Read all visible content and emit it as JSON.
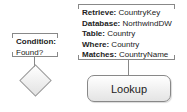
{
  "condition_note": {
    "label": "Condition:",
    "value": "Found?"
  },
  "lookup_note": {
    "rows": [
      {
        "key": "Retrieve:",
        "value": " CountryKey"
      },
      {
        "key": "Database:",
        "value": " NorthwindDW"
      },
      {
        "key": "Table:",
        "value": " Country"
      },
      {
        "key": "Where:",
        "value": " Country"
      },
      {
        "key": "Matches:",
        "value": " CountryName"
      }
    ]
  },
  "lookup_node": {
    "label": "Lookup"
  },
  "decision_node": {
    "shape": "diamond"
  }
}
